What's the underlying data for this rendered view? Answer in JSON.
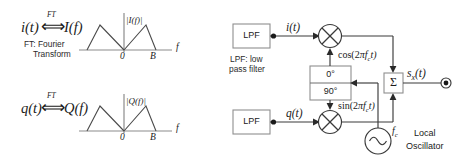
{
  "figure": {
    "left_panel": {
      "pairs": [
        {
          "id": "i-pair",
          "time_signal": "i(t)",
          "relation_symbol": "⟺",
          "relation_label": "FT",
          "freq_signal": "I(f)",
          "note_line1": "FT: Fourier",
          "note_line2": "Transform",
          "spectrum": {
            "magnitude_label": "|I(f)|",
            "axis_label": "f",
            "ticks": [
              "0",
              "B"
            ]
          }
        },
        {
          "id": "q-pair",
          "time_signal": "q(t)",
          "relation_symbol": "⟺",
          "relation_label": "FT",
          "freq_signal": "Q(f)",
          "spectrum": {
            "magnitude_label": "|Q(f)|",
            "axis_label": "f",
            "ticks": [
              "0",
              "B"
            ]
          }
        }
      ]
    },
    "right_panel": {
      "blocks": {
        "lpf_top_label": "LPF",
        "lpf_bottom_label": "LPF",
        "lpf_caption_line1": "LPF: low",
        "lpf_caption_line2": "pass filter",
        "phase_zero_label": "0°",
        "phase_ninety_label": "90°",
        "summer_label": "Σ",
        "oscillator_freq_label": "f",
        "oscillator_freq_sub": "c",
        "oscillator_name_line1": "Local",
        "oscillator_name_line2": "Oscillator"
      },
      "signals": {
        "i_branch": "i(t)",
        "q_branch": "q(t)",
        "carrier_cos_pre": "cos(2",
        "carrier_cos_pi": "π",
        "carrier_cos_f": "f",
        "carrier_cos_sub": "c",
        "carrier_cos_post": "t)",
        "carrier_sin_pre": "sin(2",
        "carrier_sin_pi": "π",
        "carrier_sin_f": "f",
        "carrier_sin_sub": "c",
        "carrier_sin_post": "t)",
        "output_base": "s",
        "output_sub": "x",
        "output_post": "(t)"
      },
      "mixer_glyph": "mixer-multiply-icon",
      "output_terminal": "output-terminal-node"
    },
    "colors": {
      "line": "#3a3a3a",
      "axis": "#8c8c8c",
      "box_stroke": "#8f8f8f",
      "text": "#1a1a1a",
      "background": "#ffffff"
    }
  }
}
